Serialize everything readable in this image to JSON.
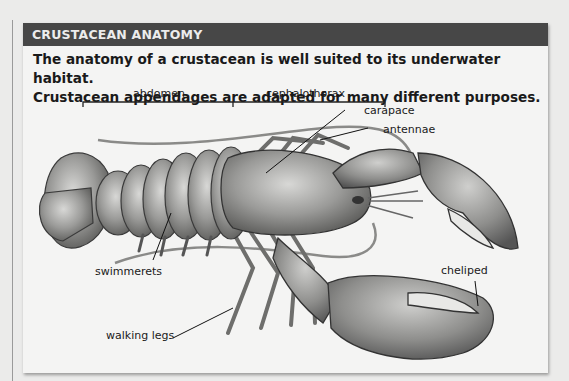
{
  "header": {
    "title": "CRUSTACEAN ANATOMY"
  },
  "intro": {
    "line1": "The anatomy of a crustacean is well suited to its underwater habitat.",
    "line2": "Crustacean appendages are adapted for many different purposes."
  },
  "diagram": {
    "brackets": [
      {
        "label": "abdomen"
      },
      {
        "label": "cephalothorax"
      }
    ],
    "labels": {
      "abdomen": "abdomen",
      "cephalothorax": "cephalothorax",
      "carapace": "carapace",
      "antennae": "antennae",
      "swimmerets": "swimmerets",
      "walking_legs": "walking legs",
      "cheliped": "cheliped"
    }
  },
  "colors": {
    "header_bg": "#474747",
    "header_text": "#ececec",
    "panel_bg": "#f4f4f3",
    "page_bg": "#ebebea"
  }
}
